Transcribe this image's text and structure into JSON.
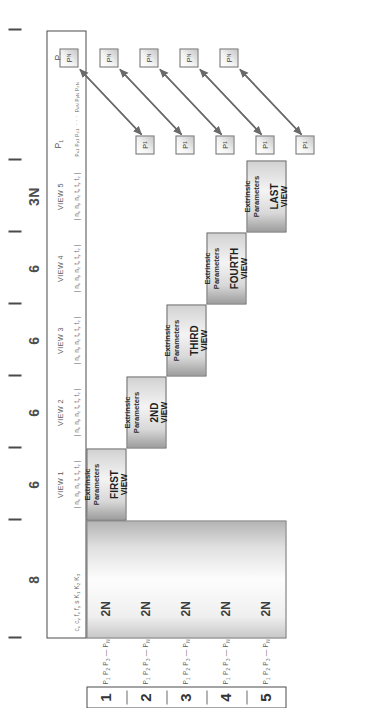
{
  "figure": {
    "accent": "#4a4a4a"
  },
  "axis": {
    "tick_labels": [
      "8",
      "6",
      "6",
      "6",
      "6",
      "3N"
    ],
    "tick_meaning": [
      "intrinsic parameters",
      "view 1 extrinsics",
      "view 2 extrinsics",
      "view 3 extrinsics",
      "view 4 extrinsics",
      "view 5 extrinsics",
      "structure points"
    ]
  },
  "header": {
    "intrinsics": {
      "label": "",
      "params": "c<sub>x</sub> c<sub>y</sub> f<sub>x</sub> f<sub>y</sub> s K<sub>1</sub> K<sub>2</sub> K<sub>3</sub>"
    },
    "views": [
      {
        "label": "VIEW 1",
        "params": "| n<sub>x</sub> n<sub>y</sub> n<sub>z</sub> t<sub>x</sub> t<sub>y</sub> t<sub>z</sub> |"
      },
      {
        "label": "VIEW 2",
        "params": "| n<sub>x</sub> n<sub>y</sub> n<sub>z</sub> t<sub>x</sub> t<sub>y</sub> t<sub>z</sub> |"
      },
      {
        "label": "VIEW 3",
        "params": "| n<sub>x</sub> n<sub>y</sub> n<sub>z</sub> t<sub>x</sub> t<sub>y</sub> t<sub>z</sub> |"
      },
      {
        "label": "VIEW 4",
        "params": "| n<sub>x</sub> n<sub>y</sub> n<sub>z</sub> t<sub>x</sub> t<sub>y</sub> t<sub>z</sub> |"
      },
      {
        "label": "VIEW 5",
        "params": "| n<sub>x</sub> n<sub>y</sub> n<sub>z</sub> t<sub>x</sub> t<sub>y</sub> t<sub>z</sub> |"
      }
    ],
    "points": {
      "first_label": "P<sub>1</sub>",
      "last_label": "P<sub>n</sub>",
      "first_coords": "p<sub>x1</sub> p<sub>y1</sub> p<sub>z1</sub>",
      "ellipsis": "· · ·",
      "last_coords": "p<sub>xN</sub> p<sub>yN</sub> p<sub>zN</sub>"
    }
  },
  "staircase": [
    {
      "caption": "Extrinsic Parameters",
      "view_name": "FIRST",
      "view_word": "VIEW"
    },
    {
      "caption": "Extrinsic Parameters",
      "view_name": "2ND",
      "view_word": "VIEW"
    },
    {
      "caption": "Extrinsic Parameters",
      "view_name": "THIRD",
      "view_word": "VIEW"
    },
    {
      "caption": "Extrinsic Parameters",
      "view_name": "FOURTH",
      "view_word": "VIEW"
    },
    {
      "caption": "Extrinsic Parameters",
      "view_name": "LAST",
      "view_word": "VIEW"
    }
  ],
  "row_groups": [
    {
      "number": "1",
      "points": "P<sub>1</sub>  P<sub>2</sub>  P<sub>3</sub>  —  P<sub>N</sub>",
      "block_label": "2N"
    },
    {
      "number": "2",
      "points": "P<sub>1</sub>  P<sub>2</sub>  P<sub>3</sub>  —  P<sub>N</sub>",
      "block_label": "2N"
    },
    {
      "number": "3",
      "points": "P<sub>1</sub>  P<sub>2</sub>  P<sub>3</sub>  —  P<sub>N</sub>",
      "block_label": "2N"
    },
    {
      "number": "4",
      "points": "P<sub>1</sub>  P<sub>2</sub>  P<sub>3</sub>  —  P<sub>N</sub>",
      "block_label": "2N"
    },
    {
      "number": "5",
      "points": "P<sub>1</sub>  P<sub>2</sub>  P<sub>3</sub>  —  P<sub>N</sub>",
      "block_label": "2N"
    }
  ],
  "point_squares": [
    {
      "start": "P<sub>1</sub>",
      "end": "P<sub>N</sub>"
    },
    {
      "start": "P<sub>1</sub>",
      "end": "P<sub>N</sub>"
    },
    {
      "start": "P<sub>1</sub>",
      "end": "P<sub>N</sub>"
    },
    {
      "start": "P<sub>1</sub>",
      "end": "P<sub>N</sub>"
    },
    {
      "start": "P<sub>1</sub>",
      "end": "P<sub>N</sub>"
    }
  ]
}
